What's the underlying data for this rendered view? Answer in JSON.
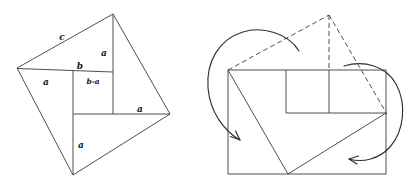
{
  "figure": {
    "background_color": "#ffffff",
    "stroke_color": "#3a3a42",
    "label_color": "#17171c",
    "labels": {
      "hypotenuse": "c",
      "leg_top_right": "a",
      "leg_mid_left": "a",
      "leg_right": "a",
      "leg_bottom": "a",
      "base_b": "b",
      "difference": "b-a"
    },
    "left_diagram": {
      "name": "tilted-square-dissection",
      "outer_vertices": [
        [
          17,
          68
        ],
        [
          113,
          14
        ],
        [
          170,
          114
        ],
        [
          73,
          175
        ]
      ],
      "inner_square": {
        "x": 73,
        "y": 72,
        "w": 40,
        "h": 42
      },
      "segment_horizontal_top": [
        [
          17,
          72
        ],
        [
          113,
          72
        ]
      ],
      "segment_horizontal_mid": [
        [
          73,
          114
        ],
        [
          170,
          114
        ]
      ],
      "segment_vertical_upper": [
        [
          113,
          14
        ],
        [
          113,
          72
        ]
      ],
      "segment_vertical_lower": [
        [
          73,
          114
        ],
        [
          73,
          175
        ]
      ],
      "label_positions": {
        "c": [
          62,
          37
        ],
        "a_top_right": [
          105,
          53
        ],
        "b": [
          78,
          66
        ],
        "b_minus_a": [
          86,
          81
        ],
        "a_mid_left": [
          45,
          82
        ],
        "a_right": [
          138,
          110
        ],
        "a_bottom": [
          79,
          145
        ]
      }
    },
    "right_diagram": {
      "name": "rearranged-rectangle",
      "rectangle": {
        "x": 228,
        "y": 70,
        "w": 158,
        "h": 104
      },
      "inner_square": {
        "x": 286,
        "y": 70,
        "w": 43,
        "h": 43
      },
      "dashed_apex": [
        329,
        15
      ],
      "dashed_left_edge": [
        [
          228,
          70
        ],
        [
          329,
          15
        ]
      ],
      "dashed_vertical": [
        [
          329,
          15
        ],
        [
          329,
          70
        ]
      ],
      "dashed_right_edge": [
        [
          329,
          15
        ],
        [
          386,
          113
        ]
      ],
      "diagonal_left": [
        [
          228,
          70
        ],
        [
          288,
          174
        ]
      ],
      "diagonal_right": [
        [
          288,
          174
        ],
        [
          386,
          113
        ]
      ],
      "notch_horizontal": [
        [
          286,
          113
        ],
        [
          386,
          113
        ]
      ],
      "arrows": [
        {
          "name": "rotate-left-arrow",
          "direction": "counterclockwise"
        },
        {
          "name": "rotate-right-arrow",
          "direction": "clockwise"
        }
      ]
    }
  }
}
